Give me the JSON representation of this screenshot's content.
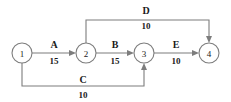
{
  "diagram": {
    "type": "activity-on-arrow-network",
    "background_color": "#ffffff",
    "stroke_color": "#7d7d7d",
    "text_color": "#1a1a1a",
    "nodes": [
      {
        "id": "1",
        "label": "1",
        "cx": 22,
        "cy": 53,
        "r": 10
      },
      {
        "id": "2",
        "label": "2",
        "cx": 86,
        "cy": 53,
        "r": 10
      },
      {
        "id": "3",
        "label": "3",
        "cx": 144,
        "cy": 53,
        "r": 10
      },
      {
        "id": "4",
        "label": "4",
        "cx": 209,
        "cy": 53,
        "r": 10
      }
    ],
    "edges": [
      {
        "id": "A",
        "name": "A",
        "duration": "15",
        "from": "1",
        "to": "2",
        "name_x": 54,
        "name_y": 48,
        "duration_x": 54,
        "duration_y": 64
      },
      {
        "id": "B",
        "name": "B",
        "duration": "15",
        "from": "2",
        "to": "3",
        "name_x": 115,
        "name_y": 48,
        "duration_x": 115,
        "duration_y": 64
      },
      {
        "id": "C",
        "name": "C",
        "duration": "10",
        "from": "1",
        "to": "3",
        "name_x": 83,
        "name_y": 83,
        "duration_x": 83,
        "duration_y": 98
      },
      {
        "id": "D",
        "name": "D",
        "duration": "10",
        "from": "2",
        "to": "4",
        "name_x": 146,
        "name_y": 13,
        "duration_x": 146,
        "duration_y": 27
      },
      {
        "id": "E",
        "name": "E",
        "duration": "10",
        "from": "3",
        "to": "4",
        "name_x": 176,
        "name_y": 48,
        "duration_x": 176,
        "duration_y": 64
      }
    ]
  }
}
